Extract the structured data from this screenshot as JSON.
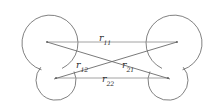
{
  "figure": {
    "background_color": "#ffffff",
    "outline_color": "#4a4a4a",
    "vector_color": "#8a8a8a",
    "label_color": "#2b2b2b",
    "width": 224,
    "height": 109
  },
  "molecules": [
    {
      "name": "left-molecule",
      "large_site": {
        "cx": 47,
        "cy": 42,
        "r": 28
      },
      "small_site": {
        "cx": 56,
        "cy": 78,
        "r": 20
      }
    },
    {
      "name": "right-molecule",
      "large_site": {
        "cx": 177,
        "cy": 42,
        "r": 28
      },
      "small_site": {
        "cx": 168,
        "cy": 78,
        "r": 20
      }
    }
  ],
  "vectors": [
    {
      "id": "r11",
      "label_base": "r",
      "label_sub": "11",
      "from": "left-large-site",
      "to": "right-large-site",
      "x1": 47,
      "y1": 42,
      "x2": 177,
      "y2": 42
    },
    {
      "id": "r12",
      "label_base": "r",
      "label_sub": "12",
      "from": "left-large-site",
      "to": "right-small-site",
      "x1": 47,
      "y1": 42,
      "x2": 168,
      "y2": 78
    },
    {
      "id": "r21",
      "label_base": "r",
      "label_sub": "21",
      "from": "left-small-site",
      "to": "right-large-site",
      "x1": 56,
      "y1": 78,
      "x2": 177,
      "y2": 42
    },
    {
      "id": "r22",
      "label_base": "r",
      "label_sub": "22",
      "from": "left-small-site",
      "to": "right-small-site",
      "x1": 56,
      "y1": 78,
      "x2": 168,
      "y2": 78
    }
  ],
  "labels": {
    "r11": {
      "base": "r",
      "sub": "11"
    },
    "r12": {
      "base": "r",
      "sub": "12"
    },
    "r21": {
      "base": "r",
      "sub": "21"
    },
    "r22": {
      "base": "r",
      "sub": "22"
    }
  }
}
